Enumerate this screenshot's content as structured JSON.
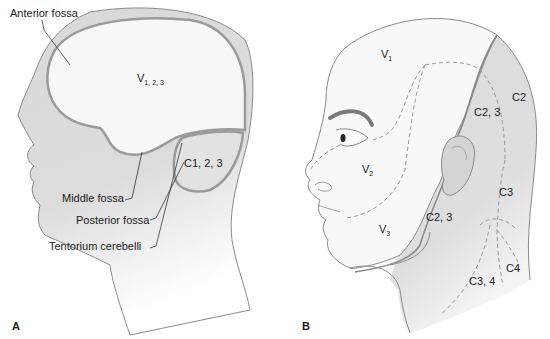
{
  "figure": {
    "panels": [
      {
        "id": "A",
        "label": "A",
        "regions": {
          "supratentorial": {
            "base": "V",
            "subscript": "1, 2, 3"
          },
          "infratentorial": "C1, 2, 3"
        },
        "callouts": [
          "Anterior fossa",
          "Middle fossa",
          "Tentorium cerebelli",
          "Posterior fossa"
        ]
      },
      {
        "id": "B",
        "label": "B",
        "trigeminal": [
          {
            "base": "V",
            "subscript": "1"
          },
          {
            "base": "V",
            "subscript": "2"
          },
          {
            "base": "V",
            "subscript": "3"
          }
        ],
        "cervical": [
          "C2",
          "C2, 3",
          "C2, 3",
          "C3",
          "C3, 4",
          "C4"
        ]
      }
    ],
    "colors": {
      "skin_gray": "#d9d9d9",
      "brain_white": "#f7f7f7",
      "outline": "#8a8a8a",
      "dura_line": "#9a9a9a",
      "dashed": "#999999",
      "text": "#1a1a1a"
    }
  }
}
